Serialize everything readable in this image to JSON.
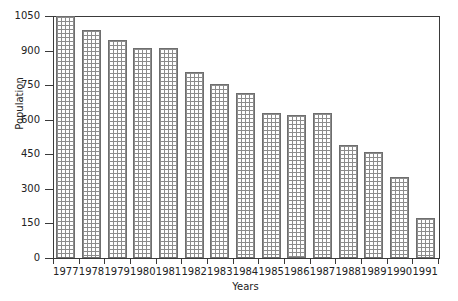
{
  "chart_data": {
    "type": "bar",
    "title": "",
    "xlabel": "Years",
    "ylabel": "Population",
    "categories": [
      "1977",
      "1978",
      "1979",
      "1980",
      "1981",
      "1982",
      "1983",
      "1984",
      "1985",
      "1986",
      "1987",
      "1988",
      "1989",
      "1990",
      "1991"
    ],
    "values": [
      1050,
      990,
      945,
      910,
      910,
      805,
      755,
      715,
      630,
      620,
      630,
      490,
      460,
      350,
      175
    ],
    "ylim": [
      0,
      1050
    ],
    "yticks": [
      0,
      150,
      300,
      450,
      600,
      750,
      900,
      1050
    ],
    "ytick_labels": [
      "0",
      "150",
      "300",
      "450",
      "600",
      "750",
      "900",
      "1050"
    ],
    "grid": false,
    "legend": "none",
    "bar_fill": "crosshatch-grid",
    "colors": {
      "bar_border": "#6e6e6e",
      "bar_hatch": "#8c8c8c",
      "axis": "#3a3a3a",
      "background": "#ffffff",
      "text": "#222222"
    }
  }
}
